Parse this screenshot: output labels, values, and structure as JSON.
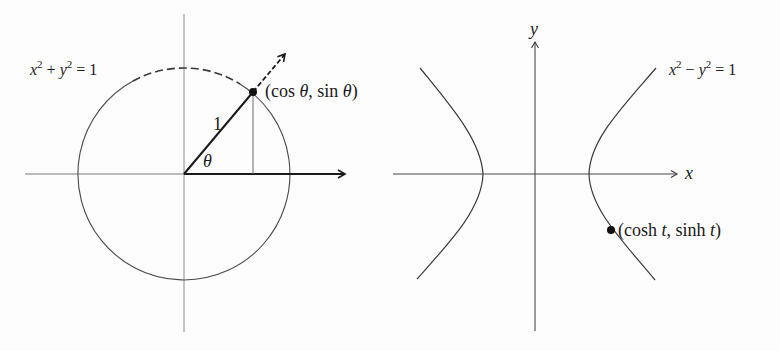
{
  "figure": {
    "left_panel": {
      "equation": {
        "lhs_x": "x",
        "exp1": "2",
        "plus": " + ",
        "lhs_y": "y",
        "exp2": "2",
        "rhs": " = 1"
      },
      "radius_label": "1",
      "angle_label": "θ",
      "point_label": {
        "open": "(cos ",
        "theta1": "θ",
        "mid": ", sin ",
        "theta2": "θ",
        "close": ")"
      },
      "circle": {
        "cx": 184,
        "cy": 174,
        "r": 106
      },
      "point": {
        "x": 253,
        "y": 92
      }
    },
    "right_panel": {
      "equation": {
        "lhs_x": "x",
        "exp1": "2",
        "minus": " − ",
        "lhs_y": "y",
        "exp2": "2",
        "rhs": " = 1"
      },
      "x_axis_label": "x",
      "y_axis_label": "y",
      "point_label": {
        "open": "(cosh ",
        "t1": "t",
        "mid": ", sinh ",
        "t2": "t",
        "close": ")"
      },
      "origin": {
        "x": 535,
        "y": 174
      },
      "vertex_left_x": 483,
      "vertex_right_x": 589,
      "point": {
        "x": 611,
        "y": 230
      }
    },
    "colors": {
      "line": "#3a3a3a",
      "thin_line": "#6f6f6f",
      "point": "#111111",
      "background": "#fdfdfd"
    }
  }
}
